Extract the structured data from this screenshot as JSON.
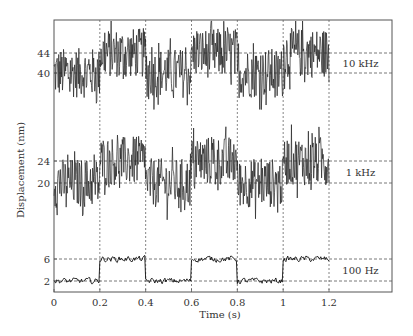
{
  "chart_data": {
    "type": "line",
    "title": "",
    "xlabel": "Time (s)",
    "ylabel": "Displacement (nm)",
    "xlim": [
      0,
      1.2
    ],
    "x_ticks": [
      "0",
      "0.2",
      "0.4",
      "0.6",
      "0.8",
      "1",
      "1.2"
    ],
    "x_tick_values": [
      0,
      0.2,
      0.4,
      0.6,
      0.8,
      1.0,
      1.2
    ],
    "grid": "dashed vertical lines at x ticks; dashed horizontal reference lines at step levels",
    "step_period_s": 0.2,
    "series": [
      {
        "name": "10 kHz",
        "label": "10 kHz",
        "low": 40,
        "high": 44,
        "y_ticks": [
          "44",
          "40"
        ],
        "noise_amplitude_nm": 5,
        "segments": [
          {
            "x": [
              0,
              0.2
            ],
            "level": 40
          },
          {
            "x": [
              0.2,
              0.4
            ],
            "level": 44
          },
          {
            "x": [
              0.4,
              0.6
            ],
            "level": 40
          },
          {
            "x": [
              0.6,
              0.8
            ],
            "level": 44
          },
          {
            "x": [
              0.8,
              1.0
            ],
            "level": 40
          },
          {
            "x": [
              1.0,
              1.2
            ],
            "level": 44
          }
        ]
      },
      {
        "name": "1 kHz",
        "label": "1 kHz",
        "low": 20,
        "high": 24,
        "y_ticks": [
          "24",
          "20"
        ],
        "noise_amplitude_nm": 4.5,
        "segments": [
          {
            "x": [
              0,
              0.2
            ],
            "level": 20
          },
          {
            "x": [
              0.2,
              0.4
            ],
            "level": 24
          },
          {
            "x": [
              0.4,
              0.6
            ],
            "level": 20
          },
          {
            "x": [
              0.6,
              0.8
            ],
            "level": 24
          },
          {
            "x": [
              0.8,
              1.0
            ],
            "level": 20
          },
          {
            "x": [
              1.0,
              1.2
            ],
            "level": 24
          }
        ]
      },
      {
        "name": "100 Hz",
        "label": "100 Hz",
        "low": 2,
        "high": 6,
        "y_ticks": [
          "6",
          "2"
        ],
        "noise_amplitude_nm": 0.9,
        "segments": [
          {
            "x": [
              0,
              0.2
            ],
            "level": 2
          },
          {
            "x": [
              0.2,
              0.4
            ],
            "level": 6
          },
          {
            "x": [
              0.4,
              0.6
            ],
            "level": 2
          },
          {
            "x": [
              0.6,
              0.8
            ],
            "level": 6
          },
          {
            "x": [
              0.8,
              1.0
            ],
            "level": 2
          },
          {
            "x": [
              1.0,
              1.2
            ],
            "level": 6
          }
        ]
      }
    ]
  }
}
